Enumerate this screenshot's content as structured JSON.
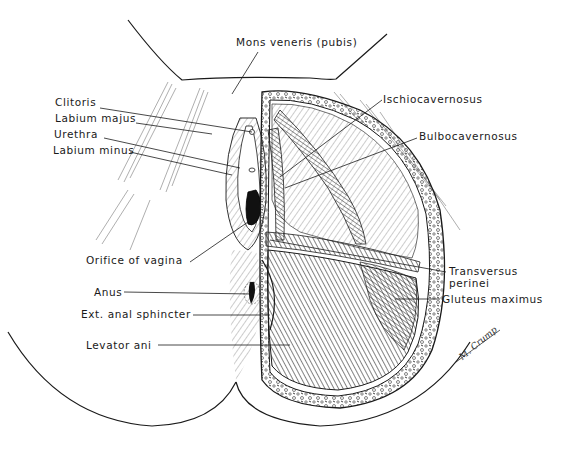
{
  "figure": {
    "ink_color": "#1a1a1a",
    "background": "#ffffff",
    "signature": "M. Crump"
  },
  "labels": [
    {
      "id": "mons-veneris",
      "text": "Mons veneris (pubis)",
      "x": 236,
      "y": 36,
      "line": [
        [
          258,
          52
        ],
        [
          232,
          94
        ]
      ]
    },
    {
      "id": "clitoris",
      "text": "Clitoris",
      "x": 55,
      "y": 96,
      "line": [
        [
          100,
          108
        ],
        [
          252,
          132
        ]
      ]
    },
    {
      "id": "labium-majus",
      "text": "Labium majus",
      "x": 55,
      "y": 112,
      "line": [
        [
          136,
          123
        ],
        [
          212,
          134
        ]
      ]
    },
    {
      "id": "urethra",
      "text": "Urethra",
      "x": 54,
      "y": 128,
      "line": [
        [
          104,
          138
        ],
        [
          240,
          168
        ]
      ]
    },
    {
      "id": "labium-minus",
      "text": "Labium minus",
      "x": 53,
      "y": 144,
      "line": [
        [
          130,
          152
        ],
        [
          232,
          175
        ]
      ]
    },
    {
      "id": "ischiocavernosus",
      "text": "Ischiocavernosus",
      "x": 383,
      "y": 93,
      "line": [
        [
          382,
          100
        ],
        [
          280,
          177
        ]
      ]
    },
    {
      "id": "bulbocavernosus",
      "text": "Bulbocavernosus",
      "x": 419,
      "y": 130,
      "line": [
        [
          417,
          138
        ],
        [
          285,
          188
        ]
      ]
    },
    {
      "id": "orifice-of-vagina",
      "text": "Orifice of vagina",
      "x": 86,
      "y": 254,
      "line": [
        [
          190,
          262
        ],
        [
          248,
          222
        ]
      ]
    },
    {
      "id": "transversus-perinei",
      "text": "Transversus\nperinei",
      "x": 449,
      "y": 265,
      "line": [
        [
          446,
          272
        ],
        [
          270,
          240
        ]
      ]
    },
    {
      "id": "anus",
      "text": "Anus",
      "x": 94,
      "y": 286,
      "line": [
        [
          124,
          292
        ],
        [
          252,
          294
        ]
      ]
    },
    {
      "id": "gluteus-maximus",
      "text": "Gluteus maximus",
      "x": 442,
      "y": 293,
      "line": [
        [
          440,
          299
        ],
        [
          395,
          299
        ]
      ]
    },
    {
      "id": "ext-anal-sphincter",
      "text": "Ext. anal sphincter",
      "x": 81,
      "y": 308,
      "line": [
        [
          193,
          315
        ],
        [
          270,
          315
        ]
      ]
    },
    {
      "id": "levator-ani",
      "text": "Levator ani",
      "x": 86,
      "y": 339,
      "line": [
        [
          158,
          345
        ],
        [
          290,
          345
        ]
      ]
    }
  ]
}
